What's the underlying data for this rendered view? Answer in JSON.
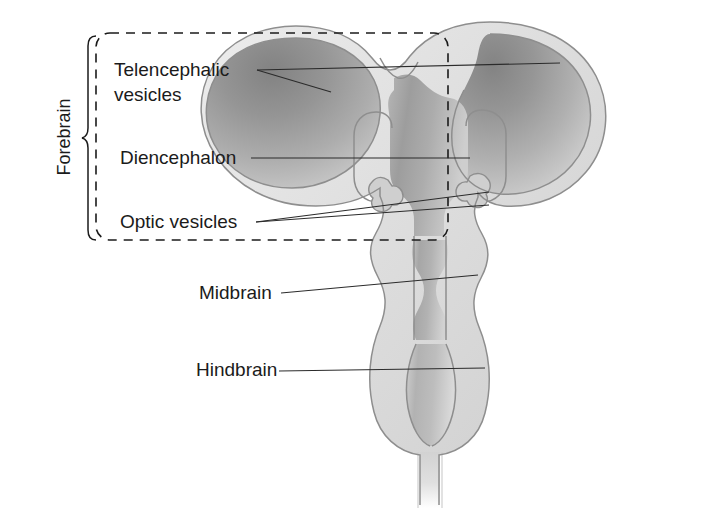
{
  "figure": {
    "background_color": "#ffffff",
    "ink_color": "#1b1b1b"
  },
  "grouping": {
    "bracket_label": "Forebrain",
    "bracket_orientation": "vertical-rotated-90ccw",
    "dashed_region": {
      "style": "dashed-rounded-rectangle",
      "x": 96,
      "y": 33,
      "width": 352,
      "height": 207
    }
  },
  "labels": [
    {
      "id": "telencephalic",
      "line1": "Telencephalic",
      "line2": "vesicles",
      "x": 114,
      "y1": 76,
      "y2": 101,
      "leader_count": 2
    },
    {
      "id": "diencephalon",
      "line1": "Diencephalon",
      "line2": "",
      "x": 120,
      "y1": 164,
      "y2": 0,
      "leader_count": 1
    },
    {
      "id": "optic",
      "line1": "Optic vesicles",
      "line2": "",
      "x": 120,
      "y1": 228,
      "y2": 0,
      "leader_count": 2
    },
    {
      "id": "midbrain",
      "line1": "Midbrain",
      "line2": "",
      "x": 199,
      "y1": 299,
      "y2": 0,
      "leader_count": 1
    },
    {
      "id": "hindbrain",
      "line1": "Hindbrain",
      "line2": "",
      "x": 196,
      "y1": 376,
      "y2": 0,
      "leader_count": 1
    }
  ],
  "anatomy": {
    "parts": [
      "left-telencephalic-vesicle",
      "right-telencephalic-vesicle",
      "diencephalon",
      "left-optic-vesicle",
      "right-optic-vesicle",
      "midbrain",
      "hindbrain",
      "spinal-cord-stalk"
    ],
    "colors": {
      "tissue_dark": "#8f8f8f",
      "tissue_mid": "#a8a8a8",
      "tissue_light": "#cfcfcf",
      "wall_band": "#e2e2e2",
      "outline": "#8e8e8e",
      "highlight": "#f2f2f2"
    }
  }
}
